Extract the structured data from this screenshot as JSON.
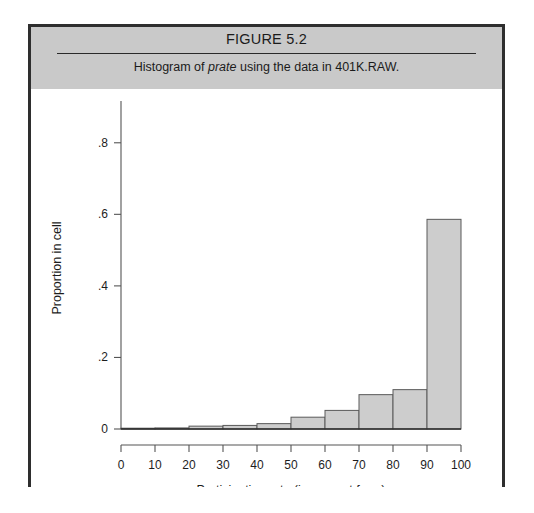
{
  "figure": {
    "title": "FIGURE 5.2",
    "subtitle_prefix": "Histogram of ",
    "subtitle_italic": "prate",
    "subtitle_suffix": " using the data in 401K.RAW."
  },
  "colors": {
    "band": "#c9c9c9",
    "frame": "#2e2e2e",
    "bar_fill": "#cdcdcd",
    "bar_stroke": "#5a5a5a",
    "axis": "#555555",
    "text": "#1d1d1d"
  },
  "chart_data": {
    "type": "bar",
    "title": "Histogram of prate using the data in 401K.RAW.",
    "xlabel": "Participation rate (in percent form)",
    "ylabel": "Proportion in cell",
    "xlim": [
      0,
      100
    ],
    "ylim": [
      0,
      0.9
    ],
    "grid": false,
    "legend": "none",
    "bin_width": 10,
    "bin_edges": [
      0,
      10,
      20,
      30,
      40,
      50,
      60,
      70,
      80,
      90,
      100
    ],
    "categories": [
      "0-10",
      "10-20",
      "20-30",
      "30-40",
      "40-50",
      "50-60",
      "60-70",
      "70-80",
      "80-90",
      "90-100"
    ],
    "values": [
      0.002,
      0.003,
      0.008,
      0.01,
      0.015,
      0.033,
      0.052,
      0.096,
      0.11,
      0.586
    ],
    "xticks": [
      0,
      10,
      20,
      30,
      40,
      50,
      60,
      70,
      80,
      90,
      100
    ],
    "xtick_labels": [
      "0",
      "10",
      "20",
      "30",
      "40",
      "50",
      "60",
      "70",
      "80",
      "90",
      "100"
    ],
    "yticks": [
      0,
      0.2,
      0.4,
      0.6,
      0.8
    ],
    "ytick_labels": [
      "0",
      ".2",
      ".4",
      ".6",
      ".8"
    ]
  }
}
